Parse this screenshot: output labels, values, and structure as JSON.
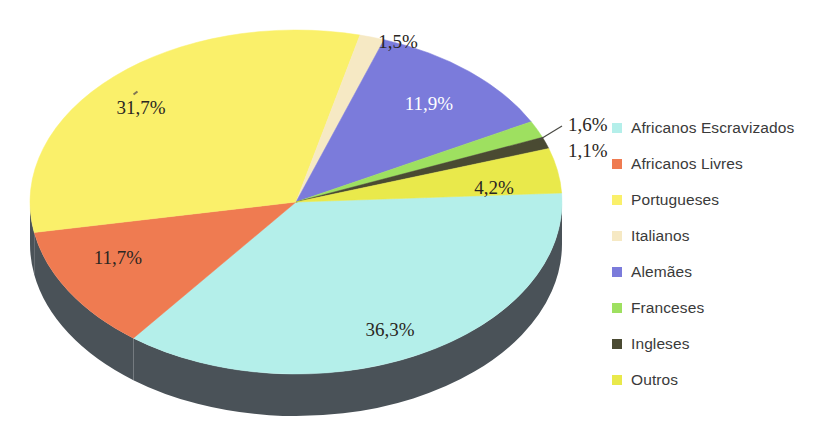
{
  "chart_data": {
    "type": "pie",
    "title": "",
    "subtitle": "",
    "xlabel": "",
    "ylabel": "",
    "grid": false,
    "legend_position": "right",
    "three_d": true,
    "decimal_separator": ",",
    "categories": [
      "Africanos Escravizados",
      "Africanos Livres",
      "Portugueses",
      "Italianos",
      "Alemães",
      "Franceses",
      "Ingleses",
      "Outros"
    ],
    "values": [
      36.3,
      11.7,
      31.7,
      1.5,
      11.9,
      1.6,
      1.1,
      4.2
    ],
    "labels": [
      "36,3%",
      "11,7%",
      "31,7%",
      "1,5%",
      "11,9%",
      "1,6%",
      "1,1%",
      "4,2%"
    ],
    "colors": [
      "#b4efea",
      "#ef7b51",
      "#faf06a",
      "#f6e9c4",
      "#7b7bdb",
      "#9ee060",
      "#4a4a32",
      "#e9e94b"
    ],
    "side_wall_color": "#4a5258",
    "label_text_color": "#2a2622",
    "legend_text_color": "#3a3a3a"
  },
  "slices": [
    {
      "name": "Africanos Escravizados",
      "value": 36.3,
      "label": "36,3%",
      "color": "#b4efea",
      "label_style": "dark",
      "label_position": "inside"
    },
    {
      "name": "Africanos Livres",
      "value": 11.7,
      "label": "11,7%",
      "color": "#ef7b51",
      "label_style": "dark",
      "label_position": "inside"
    },
    {
      "name": "Portugueses",
      "value": 31.7,
      "label": "31,7%",
      "color": "#faf06a",
      "label_style": "dark",
      "label_position": "inside"
    },
    {
      "name": "Italianos",
      "value": 1.5,
      "label": "1,5%",
      "color": "#f6e9c4",
      "label_style": "dark",
      "label_position": "outside"
    },
    {
      "name": "Alemães",
      "value": 11.9,
      "label": "11,9%",
      "color": "#7b7bdb",
      "label_style": "light",
      "label_position": "inside"
    },
    {
      "name": "Franceses",
      "value": 1.6,
      "label": "1,6%",
      "color": "#9ee060",
      "label_style": "dark",
      "label_position": "callout"
    },
    {
      "name": "Ingleses",
      "value": 1.1,
      "label": "1,1%",
      "color": "#4a4a32",
      "label_style": "dark",
      "label_position": "callout"
    },
    {
      "name": "Outros",
      "value": 4.2,
      "label": "4,2%",
      "color": "#e9e94b",
      "label_style": "dark",
      "label_position": "inside"
    }
  ],
  "labels_rendered": {
    "portugueses": "31,7%",
    "italianos": "1,5%",
    "alemaes": "11,9%",
    "franceses": "1,6%",
    "ingleses": "1,1%",
    "outros": "4,2%",
    "africanos_escravizados": "36,3%",
    "africanos_livres": "11,7%"
  },
  "legend": {
    "items": [
      {
        "label": "Africanos Escravizados",
        "color": "#b4efea"
      },
      {
        "label": "Africanos Livres",
        "color": "#ef7b51"
      },
      {
        "label": "Portugueses",
        "color": "#faf06a"
      },
      {
        "label": "Italianos",
        "color": "#f6e9c4"
      },
      {
        "label": "Alemães",
        "color": "#7b7bdb"
      },
      {
        "label": "Franceses",
        "color": "#9ee060"
      },
      {
        "label": "Ingleses",
        "color": "#4a4a32"
      },
      {
        "label": "Outros",
        "color": "#e9e94b"
      }
    ]
  }
}
